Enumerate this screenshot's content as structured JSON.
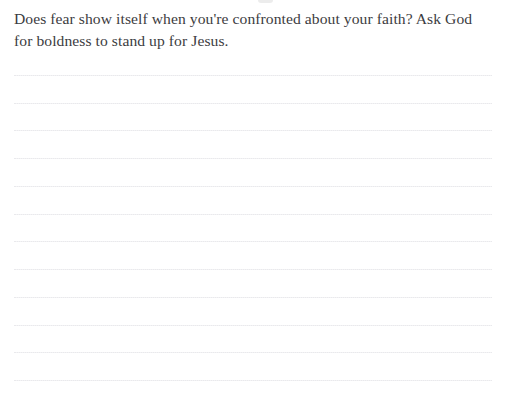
{
  "page": {
    "type": "devotional-journal-page",
    "background_color": "#ffffff",
    "width": 507,
    "height": 404
  },
  "prompt": {
    "line_1": "Does fear show itself when you're confronted about your faith? Ask God",
    "line_2": "for boldness to stand up for Jesus.",
    "full_text": "Does fear show itself when you're confronted about your faith? Ask God for boldness to stand up for Jesus.",
    "text_color": "#3c3c41"
  },
  "writing_area": {
    "label": "ruled-writing-lines",
    "line_color": "#d9d9dd",
    "line_style": "dotted",
    "line_count": 12,
    "line_left_px": 14,
    "line_right_px": 492,
    "line_positions_px": [
      75,
      103,
      130,
      158,
      186,
      214,
      241,
      269,
      297,
      325,
      352,
      380
    ]
  },
  "artifact": {
    "label": "clipped-mark-top",
    "color": "#e9e9e9"
  }
}
